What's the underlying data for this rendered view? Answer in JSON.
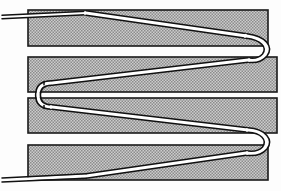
{
  "figure": {
    "title": "Serpentine tube cross-section",
    "background_color": "#fdfdfd",
    "line_color": "#111111",
    "hatch_color": "#8e8e8e",
    "hatch_background": "#c9c9c9",
    "tube_fill_color": "#ffffff",
    "canvas": {
      "width": 281,
      "height": 191
    }
  },
  "blocks": [
    {
      "id": "block-1",
      "label": "Top outer block",
      "x": 28,
      "y": 10,
      "width": 240,
      "height": 36,
      "fill": "#c4c4c4"
    },
    {
      "id": "block-2",
      "label": "Upper inner block",
      "x": 28,
      "y": 57,
      "width": 249,
      "height": 35,
      "fill": "#c4c4c4"
    },
    {
      "id": "block-3",
      "label": "Lower inner block",
      "x": 28,
      "y": 98,
      "width": 249,
      "height": 35,
      "fill": "#c4c4c4"
    },
    {
      "id": "block-4",
      "label": "Bottom outer block",
      "x": 28,
      "y": 145,
      "width": 240,
      "height": 35,
      "fill": "#c4c4c4"
    }
  ],
  "tube": {
    "label": "Serpentine tube",
    "segments": [
      {
        "id": "inlet-lead",
        "label": "Inlet lead, upper left",
        "path": "M 2 17 L 86 13"
      },
      {
        "id": "pass-1",
        "label": "Pass 1 - left to right, top",
        "path": "M 86 13 L 246 36"
      },
      {
        "id": "bend-1",
        "label": "U-bend 1, right side top",
        "path": "M 246 36 C 266 39 272 48 266 55 C 262 60 256 61 248 60"
      },
      {
        "id": "pass-2",
        "label": "Pass 2 - right to left",
        "path": "M 248 60 L 52 83"
      },
      {
        "id": "joint",
        "label": "Offset connector joint, left",
        "path": "M 52 83 C 40 83 37 88 37 95 C 37 102 40 107 52 107"
      },
      {
        "id": "pass-3",
        "label": "Pass 3 - left to right",
        "path": "M 52 107 L 248 130"
      },
      {
        "id": "bend-2",
        "label": "U-bend 2, right side bottom",
        "path": "M 248 130 C 266 131 272 140 266 148 C 261 153 254 154 246 153"
      },
      {
        "id": "pass-4",
        "label": "Pass 4 - right to left, bottom",
        "path": "M 246 153 L 86 176"
      },
      {
        "id": "outlet-lead",
        "label": "Outlet lead, lower left",
        "path": "M 86 176 L 2 180"
      }
    ]
  }
}
